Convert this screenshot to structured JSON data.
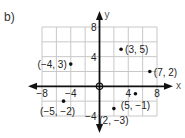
{
  "part_label": "b)",
  "chart_data": {
    "type": "scatter",
    "title": "",
    "xlabel": "x",
    "ylabel": "y",
    "xlim": [
      -8,
      8
    ],
    "ylim": [
      -4,
      8
    ],
    "grid": true,
    "grid_step": 2,
    "x_ticks": [
      -8,
      -4,
      4,
      8
    ],
    "y_ticks": [
      8,
      4,
      -4
    ],
    "x_tick_labels": [
      "−8",
      "−4",
      "4",
      "8"
    ],
    "y_tick_labels": [
      "8",
      "4",
      "−4"
    ],
    "origin_marker": true,
    "points": [
      {
        "x": -4,
        "y": 3,
        "label": "(−4, 3)"
      },
      {
        "x": 3,
        "y": 5,
        "label": "(3, 5)"
      },
      {
        "x": 7,
        "y": 2,
        "label": "(7, 2)"
      },
      {
        "x": -5,
        "y": -2,
        "label": "(−5, −2)"
      },
      {
        "x": 5,
        "y": -1,
        "label": "(5, −1)"
      },
      {
        "x": 2,
        "y": -3,
        "label": "(2, −3)"
      }
    ]
  },
  "colors": {
    "grid": "#c8c8c8",
    "axis": "#111111",
    "point": "#111111",
    "text": "#222222"
  }
}
